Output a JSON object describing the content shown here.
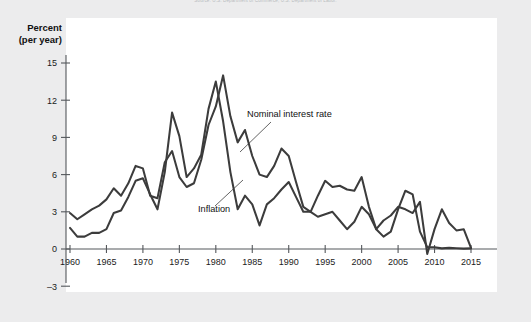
{
  "page": {
    "top_note": "Source: U.S. Department of Commerce; U.S. Department of Labor."
  },
  "axis_title": {
    "line1": "Percent",
    "line2": "(per year)"
  },
  "annotations": {
    "nominal": "Nominal interest rate",
    "inflation": "Inflation"
  },
  "colors": {
    "background": "#ececed",
    "plate": "#ffffff",
    "line": "#3c3c3c",
    "axis": "#55585c",
    "text": "#111111"
  },
  "chart_data": {
    "type": "line",
    "title": "",
    "xlabel": "",
    "ylabel": "Percent (per year)",
    "xlim": [
      1960,
      2015
    ],
    "ylim": [
      -3,
      16
    ],
    "xticks": [
      1960,
      1965,
      1970,
      1975,
      1980,
      1985,
      1990,
      1995,
      2000,
      2005,
      2010,
      2015
    ],
    "yticks": [
      -3,
      0,
      3,
      6,
      9,
      12,
      15
    ],
    "grid": false,
    "legend": "inline-annotations",
    "x": [
      1960,
      1961,
      1962,
      1963,
      1964,
      1965,
      1966,
      1967,
      1968,
      1969,
      1970,
      1971,
      1972,
      1973,
      1974,
      1975,
      1976,
      1977,
      1978,
      1979,
      1980,
      1981,
      1982,
      1983,
      1984,
      1985,
      1986,
      1987,
      1988,
      1989,
      1990,
      1991,
      1992,
      1993,
      1994,
      1995,
      1996,
      1997,
      1998,
      1999,
      2000,
      2001,
      2002,
      2003,
      2004,
      2005,
      2006,
      2007,
      2008,
      2009,
      2010,
      2011,
      2012,
      2013,
      2014,
      2015
    ],
    "series": [
      {
        "name": "Nominal interest rate",
        "values": [
          2.9,
          2.4,
          2.8,
          3.2,
          3.5,
          4.0,
          4.9,
          4.3,
          5.3,
          6.7,
          6.5,
          4.3,
          4.1,
          7.0,
          7.9,
          5.8,
          5.0,
          5.3,
          7.2,
          10.0,
          11.5,
          14.0,
          10.7,
          8.6,
          9.6,
          7.5,
          6.0,
          5.8,
          6.7,
          8.1,
          7.5,
          5.4,
          3.4,
          3.0,
          4.3,
          5.5,
          5.0,
          5.1,
          4.8,
          4.7,
          5.8,
          3.4,
          1.6,
          1.0,
          1.4,
          3.2,
          4.7,
          4.4,
          1.4,
          0.15,
          0.14,
          0.05,
          0.09,
          0.06,
          0.03,
          0.05
        ]
      },
      {
        "name": "Inflation",
        "values": [
          1.7,
          1.0,
          1.0,
          1.3,
          1.3,
          1.6,
          2.9,
          3.1,
          4.2,
          5.5,
          5.7,
          4.4,
          3.2,
          6.2,
          11.0,
          9.1,
          5.8,
          6.5,
          7.6,
          11.3,
          13.5,
          10.3,
          6.2,
          3.2,
          4.3,
          3.6,
          1.9,
          3.6,
          4.1,
          4.8,
          5.4,
          4.2,
          3.0,
          3.0,
          2.6,
          2.8,
          3.0,
          2.3,
          1.6,
          2.2,
          3.4,
          2.8,
          1.6,
          2.3,
          2.7,
          3.4,
          3.2,
          2.9,
          3.8,
          -0.4,
          1.6,
          3.2,
          2.1,
          1.5,
          1.6,
          0.1
        ]
      }
    ]
  }
}
